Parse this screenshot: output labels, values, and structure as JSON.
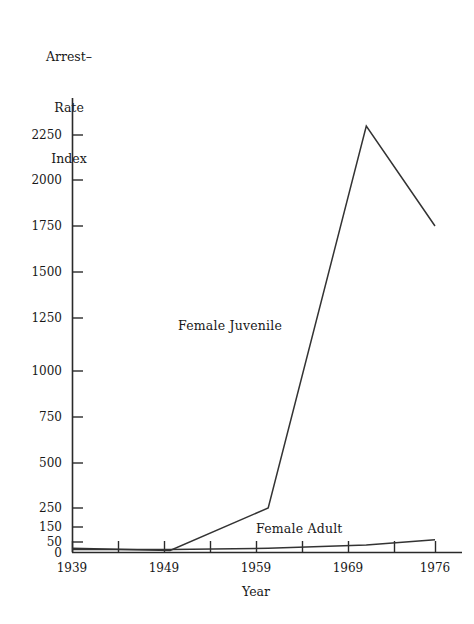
{
  "chart_data": {
    "type": "line",
    "title": "",
    "ylabel": "Arrest-\nRate\nIndex",
    "ylabel_lines": [
      "Arrest–",
      "Rate",
      "Index"
    ],
    "xlabel": "Year",
    "x": [
      1939,
      1949,
      1959,
      1969,
      1976
    ],
    "xtick_labels": [
      "1939",
      "1949",
      "1959",
      "1969",
      "1976"
    ],
    "xlim": [
      1939,
      1976
    ],
    "xminor_ticks": [
      1944,
      1954,
      1964,
      1974
    ],
    "ytick_labels": [
      "0",
      "50",
      "150",
      "250",
      "500",
      "750",
      "1000",
      "1250",
      "1500",
      "1750",
      "2000",
      "2250"
    ],
    "ytick_values": [
      0,
      50,
      150,
      250,
      500,
      750,
      1000,
      1250,
      1500,
      1750,
      2000,
      2250
    ],
    "ylim": [
      0,
      2400
    ],
    "yscale_note": "non-linear compressed below 250",
    "grid": false,
    "legend": "inline-labels",
    "series": [
      {
        "name": "Female Juvenile",
        "label_position": {
          "x": 1945.0,
          "y": 1170
        },
        "values": [
          20,
          10,
          250,
          2300,
          1750
        ]
      },
      {
        "name": "Female Adult",
        "label_position": {
          "x": 1958.9,
          "y": 150
        },
        "values": [
          15,
          15,
          20,
          35,
          65
        ]
      }
    ]
  },
  "labels": {
    "y_axis_title_line1": "Arrest–",
    "y_axis_title_line2": "Rate",
    "y_axis_title_line3": "Index",
    "x_axis_title": "Year",
    "series_juvenile": "Female Juvenile",
    "series_adult": "Female Adult",
    "ytick_0": "0",
    "ytick_50": "50",
    "ytick_150": "150",
    "ytick_250": "250",
    "ytick_500": "500",
    "ytick_750": "750",
    "ytick_1000": "1000",
    "ytick_1250": "1250",
    "ytick_1500": "1500",
    "ytick_1750": "1750",
    "ytick_2000": "2000",
    "ytick_2250": "2250",
    "xtick_1939": "1939",
    "xtick_1949": "1949",
    "xtick_1959": "1959",
    "xtick_1969": "1969",
    "xtick_1976": "1976"
  },
  "colors": {
    "background": "#ffffff",
    "ink": "#1c1c1c",
    "axis": "#2a2a2a",
    "series_line": "#333333"
  }
}
